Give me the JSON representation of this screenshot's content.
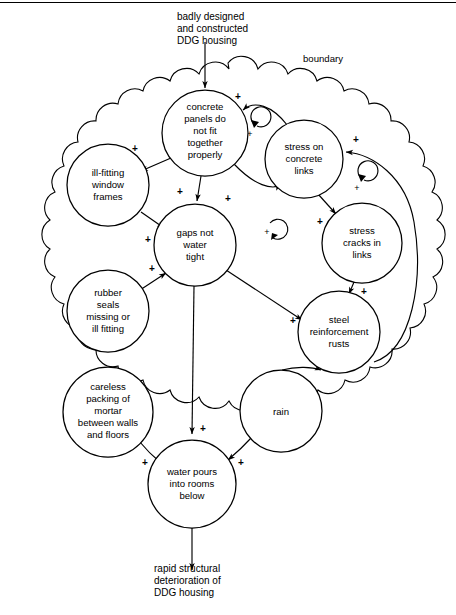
{
  "diagram": {
    "title_top": [
      "badly designed",
      "and constructed",
      "DDG housing"
    ],
    "title_bottom": [
      "rapid structural",
      "deterioration of",
      "DDG housing"
    ],
    "boundary_label": "boundary",
    "nodes": [
      {
        "id": "panels",
        "lines": [
          "concrete",
          "panels do",
          "not fit",
          "together",
          "properly"
        ],
        "cx": 205,
        "cy": 133,
        "r": 43
      },
      {
        "id": "stress",
        "lines": [
          "stress on",
          "concrete",
          "links"
        ],
        "cx": 304,
        "cy": 159,
        "r": 39
      },
      {
        "id": "cracks",
        "lines": [
          "stress",
          "cracks in",
          "links"
        ],
        "cx": 362,
        "cy": 243,
        "r": 40
      },
      {
        "id": "windows",
        "lines": [
          "ill-fitting",
          "window",
          "frames"
        ],
        "cx": 108,
        "cy": 185,
        "r": 41
      },
      {
        "id": "gaps",
        "lines": [
          "gaps not",
          "water",
          "tight"
        ],
        "cx": 195,
        "cy": 245,
        "r": 41
      },
      {
        "id": "seals",
        "lines": [
          "rubber",
          "seals",
          "missing or",
          "ill fitting"
        ],
        "cx": 108,
        "cy": 311,
        "r": 41
      },
      {
        "id": "steel",
        "lines": [
          "steel",
          "reinforcement",
          "rusts"
        ],
        "cx": 339,
        "cy": 332,
        "r": 41
      },
      {
        "id": "mortar",
        "lines": [
          "careless",
          "packing of",
          "mortar",
          "between walls",
          "and floors"
        ],
        "cx": 108,
        "cy": 412,
        "r": 45
      },
      {
        "id": "rain",
        "lines": [
          "rain"
        ],
        "cx": 281,
        "cy": 411,
        "r": 41
      },
      {
        "id": "water",
        "lines": [
          "water pours",
          "into rooms",
          "below"
        ],
        "cx": 192,
        "cy": 484,
        "r": 44
      }
    ],
    "links": [
      {
        "from": "external-top",
        "to": "panels",
        "sign": ""
      },
      {
        "from": "panels",
        "to": "stress",
        "sign": "+"
      },
      {
        "from": "stress",
        "to": "panels",
        "sign": "+"
      },
      {
        "from": "panels",
        "to": "windows",
        "sign": "+"
      },
      {
        "from": "panels",
        "to": "gaps",
        "sign": "+"
      },
      {
        "from": "windows",
        "to": "gaps",
        "sign": "+"
      },
      {
        "from": "seals",
        "to": "gaps",
        "sign": "+"
      },
      {
        "from": "stress",
        "to": "cracks",
        "sign": "+"
      },
      {
        "from": "cracks",
        "to": "steel",
        "sign": "+"
      },
      {
        "from": "steel",
        "to": "stress",
        "sign": "+"
      },
      {
        "from": "gaps",
        "to": "steel",
        "sign": "+"
      },
      {
        "from": "gaps",
        "to": "water",
        "sign": "+"
      },
      {
        "from": "mortar",
        "to": "water",
        "sign": "+"
      },
      {
        "from": "rain",
        "to": "water",
        "sign": "+"
      },
      {
        "from": "rain",
        "to": "steel",
        "sign": "+"
      },
      {
        "from": "water",
        "to": "external-bottom",
        "sign": ""
      }
    ],
    "loops": [
      {
        "id": "loop-panels-stress",
        "cx": 250,
        "cy": 133,
        "sign": "+"
      },
      {
        "id": "loop-stress-cracks",
        "cx": 357,
        "cy": 187,
        "sign": "+"
      },
      {
        "id": "loop-center",
        "cx": 267,
        "cy": 231,
        "sign": "+"
      }
    ],
    "colors": {
      "ink": "#000000",
      "paper": "#ffffff"
    }
  }
}
